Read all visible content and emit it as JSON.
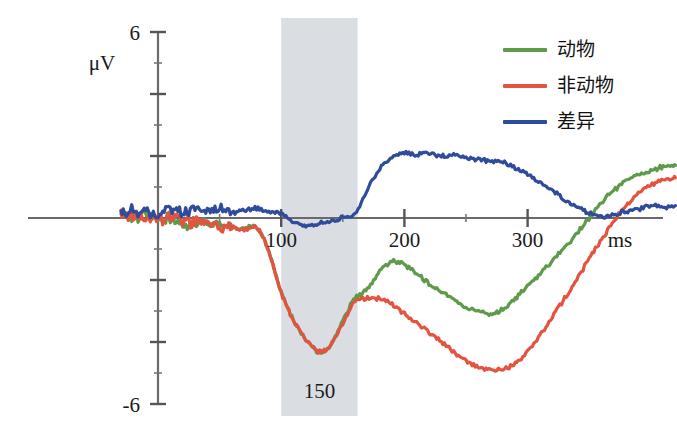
{
  "figure": {
    "type": "erp-waveform-plot",
    "background": "#ffffff"
  },
  "axes": {
    "y_unit_label": "μV",
    "y_top_label": "6",
    "y_bottom_label": "-6",
    "x_tick_labels": [
      "100",
      "200",
      "300"
    ],
    "x_unit_label": "ms"
  },
  "band": {
    "label": "150",
    "color": "#d3d7dd",
    "start_ms": 100,
    "end_ms": 162
  },
  "legend": {
    "items": [
      {
        "label": "动物",
        "color": "#5d9b4b"
      },
      {
        "label": "非动物",
        "color": "#e4533f"
      },
      {
        "label": "差异",
        "color": "#2f4b9c"
      }
    ]
  },
  "chart_data": {
    "type": "line",
    "title": "",
    "xlabel": "ms",
    "ylabel": "μV",
    "xlim": [
      -30,
      420
    ],
    "ylim": [
      -6,
      6
    ],
    "grid": false,
    "legend_position": "top-right",
    "annotations": [
      {
        "text": "150",
        "x_ms": 131,
        "y_uv": -5.4,
        "note": "label inside shaded time window"
      },
      {
        "text": "ms",
        "x_ms": 375,
        "y_uv": -0.85,
        "note": "x-axis unit"
      }
    ],
    "shaded_region": {
      "x_start_ms": 100,
      "x_end_ms": 162,
      "color": "#d3d7dd"
    },
    "x": [
      -30,
      -20,
      -10,
      0,
      10,
      20,
      30,
      40,
      50,
      60,
      70,
      80,
      90,
      100,
      110,
      120,
      130,
      140,
      150,
      160,
      170,
      180,
      190,
      200,
      210,
      220,
      230,
      240,
      250,
      260,
      270,
      280,
      290,
      300,
      310,
      320,
      330,
      340,
      350,
      360,
      370,
      380,
      390,
      400,
      410,
      420
    ],
    "series": [
      {
        "name": "动物",
        "color": "#5d9b4b",
        "values": [
          0.15,
          0.05,
          0.1,
          -0.05,
          0.0,
          -0.15,
          -0.1,
          -0.2,
          -0.25,
          -0.3,
          -0.35,
          -0.3,
          -1.1,
          -2.4,
          -3.3,
          -3.9,
          -4.3,
          -4.1,
          -3.3,
          -2.6,
          -2.3,
          -1.7,
          -1.4,
          -1.5,
          -1.8,
          -2.1,
          -2.4,
          -2.6,
          -2.9,
          -3.0,
          -3.1,
          -2.95,
          -2.6,
          -2.2,
          -1.8,
          -1.4,
          -0.95,
          -0.5,
          0.0,
          0.5,
          0.9,
          1.2,
          1.4,
          1.5,
          1.65,
          1.7
        ]
      },
      {
        "name": "非动物",
        "color": "#e4533f",
        "values": [
          0.12,
          0.08,
          0.05,
          -0.02,
          0.05,
          -0.1,
          -0.15,
          -0.22,
          -0.3,
          -0.32,
          -0.38,
          -0.32,
          -1.1,
          -2.4,
          -3.3,
          -3.9,
          -4.3,
          -4.1,
          -3.4,
          -2.7,
          -2.6,
          -2.6,
          -2.8,
          -3.1,
          -3.4,
          -3.7,
          -4.0,
          -4.3,
          -4.6,
          -4.8,
          -4.9,
          -4.85,
          -4.7,
          -4.3,
          -3.8,
          -3.2,
          -2.6,
          -2.0,
          -1.3,
          -0.7,
          -0.1,
          0.4,
          0.8,
          1.05,
          1.2,
          1.3
        ]
      },
      {
        "name": "差异",
        "color": "#2f4b9c",
        "values": [
          0.2,
          0.25,
          0.2,
          0.15,
          0.25,
          0.2,
          0.3,
          0.25,
          0.3,
          0.2,
          0.25,
          0.3,
          0.2,
          0.1,
          -0.15,
          -0.25,
          -0.2,
          -0.1,
          0.0,
          0.15,
          0.9,
          1.6,
          1.95,
          2.1,
          2.05,
          2.1,
          2.0,
          2.05,
          1.95,
          1.9,
          1.85,
          1.8,
          1.6,
          1.4,
          1.15,
          0.9,
          0.6,
          0.35,
          0.15,
          0.05,
          0.1,
          0.2,
          0.3,
          0.4,
          0.35,
          0.4
        ]
      }
    ]
  }
}
